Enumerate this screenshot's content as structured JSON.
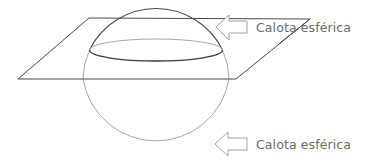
{
  "diagram": {
    "labels": [
      {
        "id": "top-cap",
        "text": "Calota esférica"
      },
      {
        "id": "bottom-cap",
        "text": "Calota esférica"
      }
    ],
    "colors": {
      "front_stroke": "#4a4a4a",
      "back_stroke": "#a8a8a8",
      "arrow_stroke": "#a0a0a0",
      "label_text": "#6b6b6b",
      "background": "#ffffff"
    }
  }
}
